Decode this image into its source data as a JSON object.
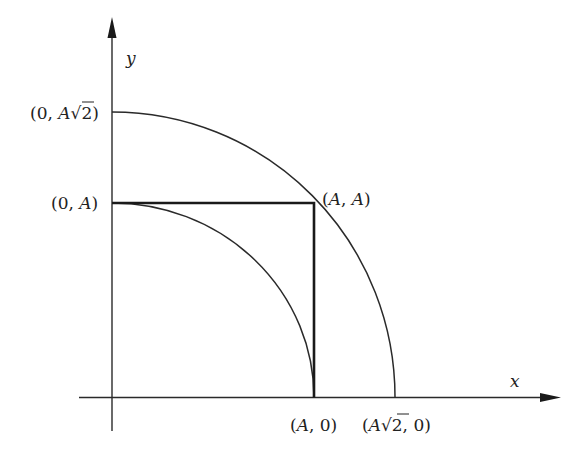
{
  "figure": {
    "type": "geometric-diagram",
    "axes": {
      "x_label": "x",
      "y_label": "y"
    },
    "labels": {
      "y_top_outer": {
        "open": "(0, ",
        "var": "A",
        "root": "√",
        "rad": "2",
        "close": ")"
      },
      "y_inner": {
        "open": "(0, ",
        "var": "A",
        "close": ")"
      },
      "corner": {
        "open": "(",
        "var1": "A",
        "sep": ", ",
        "var2": "A",
        "close": ")"
      },
      "x_inner": {
        "open": "(",
        "var": "A",
        "rest": ", 0)"
      },
      "x_outer": {
        "open": "(",
        "var": "A",
        "root": "√",
        "rad": "2",
        "rest": ", 0)"
      }
    },
    "points": [
      {
        "name": "(0, A√2)",
        "x": 0,
        "y": 1.41421
      },
      {
        "name": "(0, A)",
        "x": 0,
        "y": 1
      },
      {
        "name": "(A, A)",
        "x": 1,
        "y": 1
      },
      {
        "name": "(A, 0)",
        "x": 1,
        "y": 0
      },
      {
        "name": "(A√2, 0)",
        "x": 1.41421,
        "y": 0
      }
    ],
    "curves": [
      {
        "name": "inner-quarter-circle",
        "radius": "A"
      },
      {
        "name": "outer-quarter-circle",
        "radius": "A√2"
      }
    ],
    "colors": {
      "ink": "#222222",
      "background": "#ffffff"
    }
  }
}
